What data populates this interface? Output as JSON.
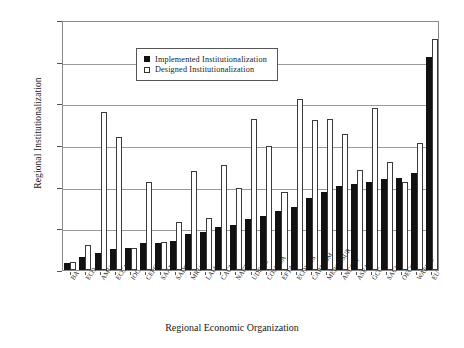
{
  "chart_data": {
    "type": "bar",
    "title": "",
    "xlabel": "Regional Economic Organization",
    "ylabel": "Regional Institutionalization",
    "ylim": [
      0,
      30
    ],
    "ytick_step": 5,
    "ytick_labels": [
      "30.00",
      "25.00",
      "20.00",
      "15.00",
      "10.00",
      "5.00",
      "0.00"
    ],
    "ytick_values": [
      30,
      25,
      20,
      15,
      10,
      5,
      0
    ],
    "grid": true,
    "legend_position": "top-left",
    "categories": [
      "BA",
      "ECO",
      "AMU",
      "ECCAS",
      "IOC",
      "CEPGL",
      "SAARC",
      "SADC",
      "MRU",
      "LAIA",
      "CACM",
      "NAFTA",
      "UDEAC",
      "COMESA",
      "EFTA",
      "ECOWAS",
      "CARICOM",
      "MERCOSUR",
      "ANCOM",
      "ASEAN",
      "GCC",
      "SACU",
      "OECS",
      "WAEMU",
      "EU"
    ],
    "series": [
      {
        "name": "Implemented Institutionalization",
        "color": "#111111",
        "style": "filled",
        "values": [
          0.9,
          1.6,
          2.1,
          2.5,
          2.6,
          3.3,
          3.3,
          3.5,
          4.3,
          4.6,
          5.2,
          5.4,
          6.1,
          6.5,
          7.1,
          7.6,
          8.7,
          9.4,
          10.1,
          10.3,
          10.6,
          10.9,
          11.0,
          11.7,
          25.6
        ]
      },
      {
        "name": "Designed Institutionalization",
        "color": "#ffffff",
        "style": "open",
        "values": [
          1.0,
          3.0,
          19.0,
          16.0,
          2.6,
          10.6,
          3.4,
          5.8,
          11.9,
          6.2,
          12.6,
          9.9,
          18.1,
          14.9,
          9.4,
          20.5,
          18.0,
          18.1,
          16.3,
          12.0,
          19.5,
          13.0,
          10.6,
          15.3,
          27.7
        ]
      }
    ]
  },
  "legend": {
    "items": [
      {
        "label": "Implemented Institutionalization",
        "style": "filled"
      },
      {
        "label": "Designed Institutionalization",
        "style": "open"
      }
    ]
  }
}
